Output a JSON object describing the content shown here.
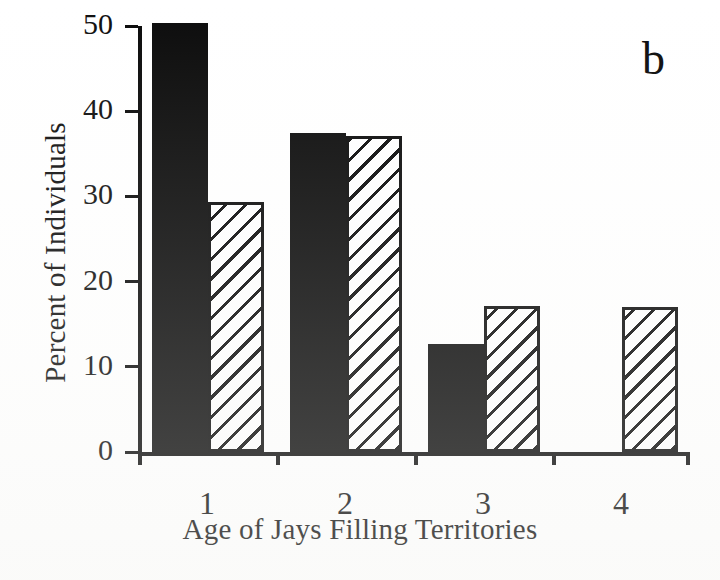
{
  "panel": {
    "label": "b"
  },
  "chart_data": {
    "type": "bar",
    "title": "",
    "subtitle": "",
    "xlabel": "Age of Jays Filling Territories",
    "ylabel": "Percent of Individuals",
    "categories": [
      "1",
      "2",
      "3",
      "4"
    ],
    "series": [
      {
        "name": "solid-black",
        "fill": "solid-black",
        "values": [
          50.3,
          37.4,
          12.7,
          0
        ]
      },
      {
        "name": "hatched",
        "fill": "diagonal-hatch",
        "values": [
          29.3,
          37.1,
          17.1,
          17.0
        ]
      }
    ],
    "ylim": [
      0,
      50
    ],
    "yticks": [
      0,
      10,
      20,
      30,
      40,
      50
    ],
    "ytick_labels": [
      "0",
      "10",
      "20",
      "30",
      "40",
      "50"
    ],
    "xtick_labels": [
      "1",
      "2",
      "3",
      "4"
    ],
    "grid": false,
    "legend": "none",
    "colors": {
      "solid": "#0c0c0c",
      "hatch_line": "#0b0b0b",
      "hatch_bg": "#ffffff",
      "axis": "#0b0b0b",
      "background": "#ffffff"
    }
  }
}
